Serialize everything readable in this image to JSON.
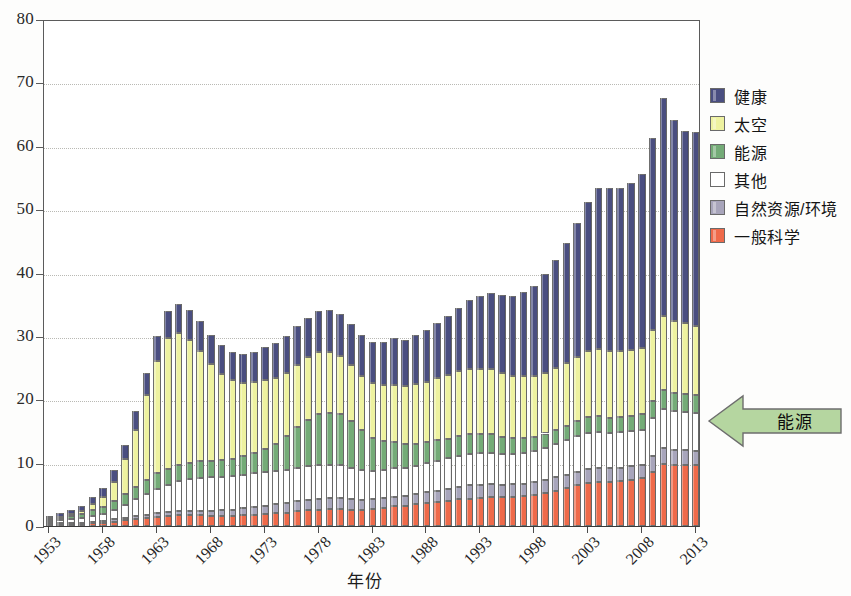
{
  "chart_data": {
    "type": "bar",
    "subtype": "stacked",
    "title": "",
    "xlabel": "年份",
    "ylabel": "",
    "ylim": [
      0,
      80
    ],
    "yticks": [
      0,
      10,
      20,
      30,
      40,
      50,
      60,
      70,
      80
    ],
    "grid": true,
    "legend_position": "right",
    "xtick_labels": [
      "1953",
      "1958",
      "1963",
      "1968",
      "1973",
      "1978",
      "1983",
      "1988",
      "1993",
      "1998",
      "2003",
      "2008",
      "2013"
    ],
    "xtick_step": 5,
    "x": [
      1953,
      1954,
      1955,
      1956,
      1957,
      1958,
      1959,
      1960,
      1961,
      1962,
      1963,
      1964,
      1965,
      1966,
      1967,
      1968,
      1969,
      1970,
      1971,
      1972,
      1973,
      1974,
      1975,
      1976,
      1977,
      1978,
      1979,
      1980,
      1981,
      1982,
      1983,
      1984,
      1985,
      1986,
      1987,
      1988,
      1989,
      1990,
      1991,
      1992,
      1993,
      1994,
      1995,
      1996,
      1997,
      1998,
      1999,
      2000,
      2001,
      2002,
      2003,
      2004,
      2005,
      2006,
      2007,
      2008,
      2009,
      2010,
      2011,
      2012,
      2013
    ],
    "colors": {
      "health": "#4a4e80",
      "space": "#eef2a0",
      "energy": "#74ab77",
      "other": "#ffffff",
      "natural_resources_environment": "#a8a5bb",
      "general_science": "#ef6a4a"
    },
    "series": [
      {
        "name": "一般科学",
        "key": "general_science",
        "color": "#ef6a4a",
        "stack_order": 1,
        "values": [
          0.2,
          0.2,
          0.3,
          0.3,
          0.4,
          0.5,
          0.7,
          0.9,
          1.1,
          1.3,
          1.5,
          1.6,
          1.7,
          1.7,
          1.7,
          1.6,
          1.6,
          1.6,
          1.7,
          1.8,
          1.9,
          2.0,
          2.1,
          2.3,
          2.5,
          2.6,
          2.7,
          2.7,
          2.6,
          2.6,
          2.7,
          2.9,
          3.1,
          3.2,
          3.4,
          3.6,
          3.8,
          4.0,
          4.2,
          4.3,
          4.4,
          4.5,
          4.5,
          4.6,
          4.7,
          4.9,
          5.2,
          5.6,
          6.0,
          6.4,
          6.8,
          7.0,
          7.0,
          7.1,
          7.3,
          7.5,
          8.6,
          9.8,
          9.6,
          9.7,
          9.7
        ]
      },
      {
        "name": "自然资源/环境",
        "key": "natural_resources_environment",
        "color": "#a8a5bb",
        "stack_order": 2,
        "values": [
          0.2,
          0.2,
          0.2,
          0.2,
          0.3,
          0.3,
          0.4,
          0.4,
          0.5,
          0.5,
          0.6,
          0.6,
          0.7,
          0.7,
          0.7,
          0.8,
          0.9,
          1.0,
          1.1,
          1.2,
          1.3,
          1.4,
          1.5,
          1.6,
          1.6,
          1.7,
          1.7,
          1.7,
          1.6,
          1.5,
          1.5,
          1.5,
          1.5,
          1.5,
          1.6,
          1.7,
          1.8,
          1.9,
          2.0,
          2.1,
          2.1,
          2.1,
          2.0,
          2.0,
          2.0,
          2.0,
          2.1,
          2.1,
          2.1,
          2.2,
          2.2,
          2.2,
          2.1,
          2.1,
          2.1,
          2.1,
          2.4,
          2.5,
          2.4,
          2.3,
          2.2
        ]
      },
      {
        "name": "其他",
        "key": "other",
        "color": "#ffffff",
        "stack_order": 3,
        "values": [
          0.4,
          0.5,
          0.6,
          0.7,
          0.9,
          1.1,
          1.5,
          2.0,
          2.6,
          3.2,
          3.8,
          4.3,
          4.7,
          5.0,
          5.2,
          5.3,
          5.3,
          5.3,
          5.3,
          5.3,
          5.3,
          5.3,
          5.3,
          5.3,
          5.3,
          5.3,
          5.3,
          5.2,
          5.0,
          4.7,
          4.5,
          4.5,
          4.5,
          4.4,
          4.5,
          4.6,
          4.7,
          4.8,
          4.9,
          5.0,
          5.0,
          5.0,
          4.9,
          4.8,
          4.8,
          4.9,
          5.0,
          5.2,
          5.4,
          5.6,
          5.7,
          5.7,
          5.6,
          5.6,
          5.6,
          5.6,
          6.0,
          6.2,
          6.1,
          6.0,
          6.0
        ]
      },
      {
        "name": "能源",
        "key": "energy",
        "color": "#74ab77",
        "stack_order": 4,
        "values": [
          0.3,
          0.4,
          0.5,
          0.7,
          0.9,
          1.1,
          1.4,
          1.7,
          2.0,
          2.2,
          2.4,
          2.5,
          2.6,
          2.6,
          2.6,
          2.6,
          2.6,
          2.7,
          2.9,
          3.2,
          3.6,
          4.3,
          5.3,
          6.4,
          7.4,
          8.0,
          8.2,
          8.0,
          7.4,
          6.3,
          5.2,
          4.5,
          4.2,
          3.8,
          3.5,
          3.3,
          3.2,
          3.1,
          3.1,
          3.1,
          3.0,
          2.9,
          2.7,
          2.5,
          2.4,
          2.3,
          2.3,
          2.3,
          2.3,
          2.4,
          2.5,
          2.5,
          2.4,
          2.4,
          2.4,
          2.4,
          2.8,
          3.0,
          2.9,
          2.8,
          2.7
        ]
      },
      {
        "name": "太空",
        "key": "space",
        "color": "#eef2a0",
        "stack_order": 5,
        "values": [
          0.1,
          0.2,
          0.3,
          0.5,
          0.9,
          1.6,
          3.0,
          5.5,
          9.0,
          13.5,
          17.8,
          20.6,
          20.8,
          19.4,
          17.4,
          15.3,
          13.6,
          12.4,
          11.6,
          11.2,
          10.9,
          10.4,
          10.0,
          9.8,
          9.8,
          9.8,
          9.6,
          9.2,
          8.8,
          8.6,
          8.6,
          8.8,
          9.0,
          9.2,
          9.4,
          9.6,
          9.8,
          10.0,
          10.2,
          10.3,
          10.3,
          10.2,
          10.0,
          9.8,
          9.7,
          9.6,
          9.6,
          9.7,
          9.9,
          10.1,
          10.4,
          10.6,
          10.5,
          10.4,
          10.4,
          10.5,
          11.2,
          11.7,
          11.4,
          11.2,
          11.0
        ]
      },
      {
        "name": "健康",
        "key": "health",
        "color": "#4a4e80",
        "stack_order": 6,
        "values": [
          0.4,
          0.5,
          0.6,
          0.8,
          1.1,
          1.4,
          1.8,
          2.3,
          2.9,
          3.4,
          3.9,
          4.3,
          4.6,
          4.7,
          4.7,
          4.6,
          4.5,
          4.4,
          4.5,
          4.8,
          5.2,
          5.5,
          5.8,
          6.1,
          6.3,
          6.5,
          6.6,
          6.6,
          6.5,
          6.4,
          6.5,
          6.9,
          7.3,
          7.3,
          7.7,
          8.2,
          8.7,
          9.3,
          10.0,
          10.8,
          11.5,
          12.0,
          12.3,
          12.6,
          13.3,
          14.2,
          15.5,
          17.0,
          18.9,
          21.1,
          23.5,
          25.3,
          25.7,
          25.8,
          26.3,
          27.4,
          30.3,
          34.3,
          31.6,
          30.3,
          30.5
        ]
      }
    ],
    "totals": [
      1.6,
      2.0,
      2.5,
      3.2,
      4.5,
      6.0,
      8.8,
      12.8,
      18.1,
      24.1,
      30.1,
      33.9,
      35.1,
      34.1,
      32.3,
      30.2,
      28.5,
      27.4,
      27.1,
      27.5,
      28.2,
      28.9,
      30.0,
      31.5,
      32.9,
      33.9,
      34.1,
      33.4,
      31.9,
      30.1,
      29.0,
      29.1,
      29.6,
      29.4,
      30.1,
      31.0,
      32.0,
      33.1,
      34.4,
      35.6,
      36.3,
      36.7,
      36.4,
      36.3,
      36.9,
      37.9,
      39.7,
      41.9,
      44.6,
      47.8,
      51.1,
      53.3,
      53.3,
      53.4,
      54.1,
      55.5,
      61.3,
      67.5,
      64.0,
      62.3,
      62.1
    ]
  },
  "legend": {
    "items": [
      {
        "label": "健康",
        "color": "#4a4e80"
      },
      {
        "label": "太空",
        "color": "#eef2a0"
      },
      {
        "label": "能源",
        "color": "#74ab77"
      },
      {
        "label": "其他",
        "color": "#ffffff"
      },
      {
        "label": "自然资源/环境",
        "color": "#a8a5bb"
      },
      {
        "label": "一般科学",
        "color": "#ef6a4a"
      }
    ]
  },
  "annotation": {
    "arrow_label": "能源",
    "arrow_direction": "left",
    "arrow_fill": "#b5d6a0",
    "arrow_stroke": "#6d6d6d"
  }
}
